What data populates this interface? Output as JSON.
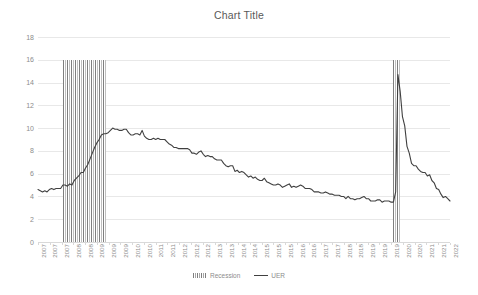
{
  "chart_data": {
    "type": "line",
    "title": "Chart Title",
    "xlabel": "",
    "ylabel": "",
    "ylim": [
      0,
      18
    ],
    "ytick_step": 2,
    "yticks": [
      18,
      16,
      14,
      12,
      10,
      8,
      6,
      4,
      2,
      0
    ],
    "grid": true,
    "legend_position": "bottom",
    "legend": [
      "Recession",
      "UER"
    ],
    "xlim_labels": [
      "2007",
      "2022"
    ],
    "xtick_labels": [
      "2007",
      "2007",
      "2007",
      "2008",
      "2008",
      "2009",
      "2009",
      "2009",
      "2010",
      "2010",
      "2011",
      "2011",
      "2012",
      "2012",
      "2012",
      "2013",
      "2013",
      "2014",
      "2014",
      "2015",
      "2015",
      "2015",
      "2016",
      "2016",
      "2017",
      "2017",
      "2018",
      "2018",
      "2019",
      "2019",
      "2019",
      "2020",
      "2020",
      "2021",
      "2021",
      "2022"
    ],
    "series": [
      {
        "name": "UER",
        "color": "#404040",
        "x": [
          "2007-01",
          "2007-02",
          "2007-03",
          "2007-04",
          "2007-05",
          "2007-06",
          "2007-07",
          "2007-08",
          "2007-09",
          "2007-10",
          "2007-11",
          "2007-12",
          "2008-01",
          "2008-02",
          "2008-03",
          "2008-04",
          "2008-05",
          "2008-06",
          "2008-07",
          "2008-08",
          "2008-09",
          "2008-10",
          "2008-11",
          "2008-12",
          "2009-01",
          "2009-02",
          "2009-03",
          "2009-04",
          "2009-05",
          "2009-06",
          "2009-07",
          "2009-08",
          "2009-09",
          "2009-10",
          "2009-11",
          "2009-12",
          "2010-01",
          "2010-02",
          "2010-03",
          "2010-04",
          "2010-05",
          "2010-06",
          "2010-07",
          "2010-08",
          "2010-09",
          "2010-10",
          "2010-11",
          "2010-12",
          "2011-01",
          "2011-02",
          "2011-03",
          "2011-04",
          "2011-05",
          "2011-06",
          "2011-07",
          "2011-08",
          "2011-09",
          "2011-10",
          "2011-11",
          "2011-12",
          "2012-01",
          "2012-02",
          "2012-03",
          "2012-04",
          "2012-05",
          "2012-06",
          "2012-07",
          "2012-08",
          "2012-09",
          "2012-10",
          "2012-11",
          "2012-12",
          "2013-01",
          "2013-02",
          "2013-03",
          "2013-04",
          "2013-05",
          "2013-06",
          "2013-07",
          "2013-08",
          "2013-09",
          "2013-10",
          "2013-11",
          "2013-12",
          "2014-01",
          "2014-02",
          "2014-03",
          "2014-04",
          "2014-05",
          "2014-06",
          "2014-07",
          "2014-08",
          "2014-09",
          "2014-10",
          "2014-11",
          "2014-12",
          "2015-01",
          "2015-02",
          "2015-03",
          "2015-04",
          "2015-05",
          "2015-06",
          "2015-07",
          "2015-08",
          "2015-09",
          "2015-10",
          "2015-11",
          "2015-12",
          "2016-01",
          "2016-02",
          "2016-03",
          "2016-04",
          "2016-05",
          "2016-06",
          "2016-07",
          "2016-08",
          "2016-09",
          "2016-10",
          "2016-11",
          "2016-12",
          "2017-01",
          "2017-02",
          "2017-03",
          "2017-04",
          "2017-05",
          "2017-06",
          "2017-07",
          "2017-08",
          "2017-09",
          "2017-10",
          "2017-11",
          "2017-12",
          "2018-01",
          "2018-02",
          "2018-03",
          "2018-04",
          "2018-05",
          "2018-06",
          "2018-07",
          "2018-08",
          "2018-09",
          "2018-10",
          "2018-11",
          "2018-12",
          "2019-01",
          "2019-02",
          "2019-03",
          "2019-04",
          "2019-05",
          "2019-06",
          "2019-07",
          "2019-08",
          "2019-09",
          "2019-10",
          "2019-11",
          "2019-12",
          "2020-01",
          "2020-02",
          "2020-03",
          "2020-04",
          "2020-05",
          "2020-06",
          "2020-07",
          "2020-08",
          "2020-09",
          "2020-10",
          "2020-11",
          "2020-12",
          "2021-01",
          "2021-02",
          "2021-03",
          "2021-04",
          "2021-05",
          "2021-06",
          "2021-07",
          "2021-08",
          "2021-09",
          "2021-10",
          "2021-11",
          "2021-12",
          "2022-01",
          "2022-02",
          "2022-03"
        ],
        "values": [
          4.6,
          4.5,
          4.4,
          4.5,
          4.4,
          4.6,
          4.7,
          4.6,
          4.7,
          4.7,
          4.7,
          5.0,
          5.0,
          4.9,
          5.1,
          5.0,
          5.4,
          5.6,
          5.8,
          6.1,
          6.1,
          6.5,
          6.8,
          7.3,
          7.8,
          8.3,
          8.7,
          9.0,
          9.4,
          9.5,
          9.5,
          9.6,
          9.8,
          10.0,
          9.9,
          9.9,
          9.8,
          9.8,
          9.9,
          9.9,
          9.6,
          9.4,
          9.4,
          9.5,
          9.5,
          9.4,
          9.8,
          9.3,
          9.1,
          9.0,
          9.0,
          9.1,
          9.0,
          9.1,
          9.0,
          9.0,
          9.0,
          8.8,
          8.6,
          8.5,
          8.3,
          8.3,
          8.2,
          8.2,
          8.2,
          8.2,
          8.2,
          8.1,
          7.8,
          7.8,
          7.7,
          7.9,
          8.0,
          7.7,
          7.5,
          7.6,
          7.5,
          7.5,
          7.3,
          7.2,
          7.2,
          7.2,
          6.9,
          6.7,
          6.6,
          6.7,
          6.7,
          6.2,
          6.3,
          6.1,
          6.2,
          6.1,
          5.9,
          5.7,
          5.8,
          5.6,
          5.7,
          5.5,
          5.4,
          5.4,
          5.6,
          5.3,
          5.2,
          5.1,
          5.0,
          5.0,
          5.1,
          5.0,
          4.8,
          4.9,
          5.0,
          5.1,
          4.8,
          4.9,
          4.8,
          4.9,
          5.0,
          4.9,
          4.7,
          4.7,
          4.7,
          4.6,
          4.4,
          4.4,
          4.4,
          4.3,
          4.3,
          4.4,
          4.3,
          4.2,
          4.2,
          4.1,
          4.1,
          4.1,
          4.0,
          4.0,
          3.8,
          4.0,
          3.8,
          3.8,
          3.7,
          3.8,
          3.8,
          3.9,
          4.0,
          3.8,
          3.8,
          3.6,
          3.6,
          3.6,
          3.7,
          3.7,
          3.5,
          3.6,
          3.6,
          3.6,
          3.5,
          3.5,
          4.4,
          14.7,
          13.2,
          11.0,
          10.2,
          8.4,
          7.8,
          6.9,
          6.7,
          6.7,
          6.4,
          6.2,
          6.1,
          6.1,
          5.8,
          5.9,
          5.4,
          5.2,
          4.7,
          4.6,
          4.2,
          3.9,
          4.0,
          3.8,
          3.6
        ]
      }
    ],
    "recession_bands": [
      {
        "label": "Recession",
        "start": "2007-12",
        "end": "2009-06",
        "top_value": 16
      },
      {
        "label": "Recession",
        "start": "2020-02",
        "end": "2020-04",
        "top_value": 16
      }
    ]
  }
}
